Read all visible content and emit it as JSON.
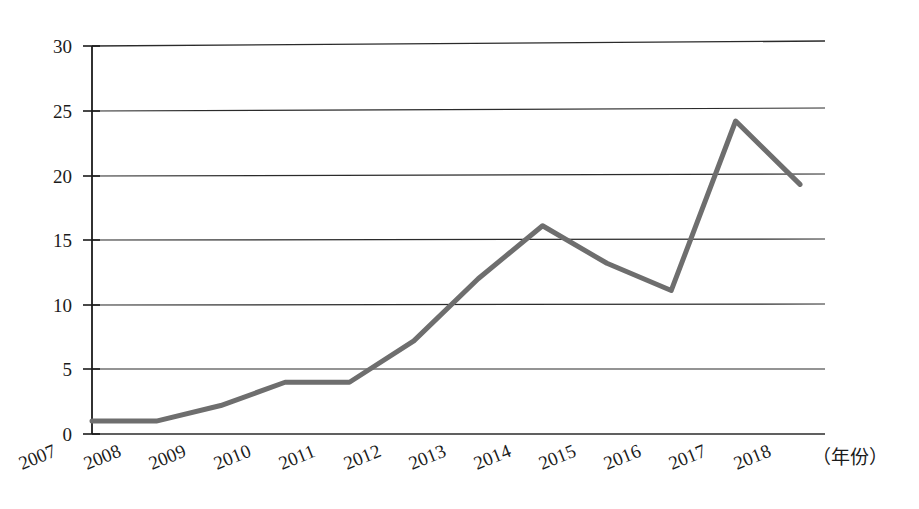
{
  "chart_data": {
    "type": "line",
    "title": "",
    "subtitle": "",
    "xlabel": "（年份）",
    "ylabel": "",
    "grid": true,
    "legend": false,
    "legend_position": "none",
    "xlim": [
      2007,
      2018
    ],
    "ylim": [
      0,
      30
    ],
    "yticks": [
      0,
      5,
      10,
      15,
      20,
      25,
      30
    ],
    "ytick_labels": [
      "0",
      "5",
      "10",
      "15",
      "20",
      "25",
      "30"
    ],
    "categories": [
      "2007",
      "2008",
      "2009",
      "2010",
      "2011",
      "2012",
      "2013",
      "2014",
      "2015",
      "2016",
      "2017",
      "2018"
    ],
    "x": [
      2007,
      2008,
      2009,
      2010,
      2011,
      2012,
      2013,
      2014,
      2015,
      2016,
      2017,
      2018
    ],
    "values": [
      1.0,
      1.0,
      2.2,
      4.0,
      4.0,
      7.2,
      12.0,
      16.1,
      13.2,
      11.1,
      24.2,
      19.3
    ],
    "series": [
      {
        "name": "",
        "values": [
          1.0,
          1.0,
          2.2,
          4.0,
          4.0,
          7.2,
          12.0,
          16.1,
          13.2,
          11.1,
          24.2,
          19.3
        ],
        "color": "#6e6e6e"
      }
    ],
    "annotations": []
  },
  "style": {
    "line_color": "#6e6e6e",
    "grid_color": "#2b2b2b",
    "axis_color": "#1b1b1b",
    "background": "#ffffff",
    "line_width": 5
  },
  "axis": {
    "x_unit_label": "（年份）",
    "x_label_rotation": "-22"
  }
}
